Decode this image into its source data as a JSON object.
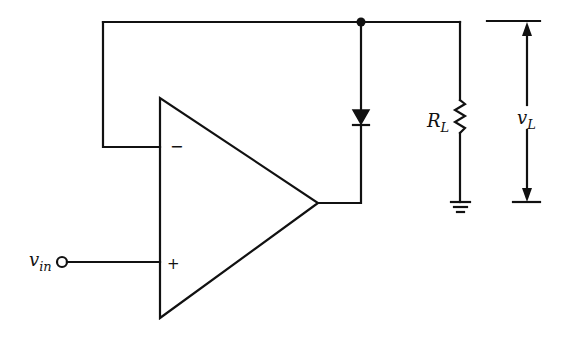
{
  "diagram": {
    "type": "circuit-schematic",
    "colors": {
      "ink": "#111111",
      "background": "#ffffff"
    },
    "labels": {
      "input_main": "v",
      "input_sub": "in",
      "resistor_main": "R",
      "resistor_sub": "L",
      "voltage_main": "v",
      "voltage_sub": "L",
      "opamp_inverting": "−",
      "opamp_noninverting": "+"
    },
    "components": [
      {
        "id": "opamp",
        "kind": "operational-amplifier"
      },
      {
        "id": "diode",
        "kind": "diode",
        "orientation": "cathode-down"
      },
      {
        "id": "load-resistor",
        "kind": "resistor",
        "label": "R_L"
      },
      {
        "id": "ground",
        "kind": "ground"
      },
      {
        "id": "input-terminal",
        "kind": "terminal",
        "label": "v_in"
      },
      {
        "id": "load-voltage",
        "kind": "voltage-arrow",
        "label": "v_L"
      }
    ]
  }
}
